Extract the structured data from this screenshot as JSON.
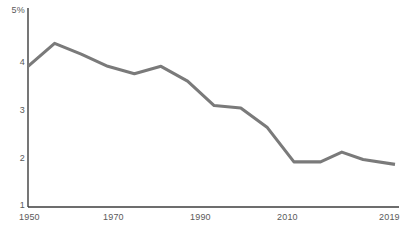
{
  "chart_data": {
    "type": "line",
    "title": "",
    "subtitle": "",
    "xlabel": "",
    "ylabel": "",
    "xlim": [
      1950,
      2019
    ],
    "ylim": [
      1,
      5
    ],
    "grid": false,
    "legend": null,
    "line_color": "#7a7a7a",
    "axis_color": "#3d3d3d",
    "x_tick_labels": [
      "1950",
      "1970",
      "1990",
      "2010",
      "2019"
    ],
    "x_tick_values": [
      1950,
      1970,
      1990,
      2010,
      2019
    ],
    "y_tick_labels": [
      "5%",
      "4",
      "3",
      "2",
      "1"
    ],
    "y_tick_values": [
      5,
      4,
      3,
      2,
      1
    ],
    "series": [
      {
        "name": "rate",
        "x": [
          1950,
          1955,
          1960,
          1965,
          1970,
          1975,
          1980,
          1985,
          1990,
          1995,
          2000,
          2005,
          2009,
          2013,
          2019
        ],
        "values": [
          3.85,
          4.32,
          4.1,
          3.85,
          3.7,
          3.85,
          3.55,
          3.05,
          3.0,
          2.6,
          1.9,
          1.9,
          2.1,
          1.95,
          1.85
        ]
      }
    ]
  }
}
